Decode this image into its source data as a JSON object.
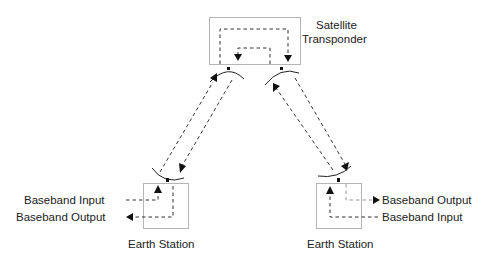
{
  "diagram": {
    "satellite": {
      "label_line1": "Satellite",
      "label_line2": "Transponder"
    },
    "earth_station_left": {
      "label": "Earth Station",
      "input_label": "Baseband Input",
      "output_label": "Baseband Output"
    },
    "earth_station_right": {
      "label": "Earth Station",
      "input_label": "Baseband Input",
      "output_label": "Baseband Output"
    },
    "colors": {
      "line": "#333333",
      "box": "#b5b5b5",
      "text": "#222222"
    }
  }
}
